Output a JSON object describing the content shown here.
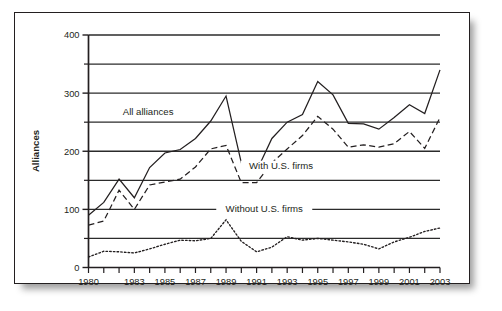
{
  "figure": {
    "name": "alliances-line-chart",
    "frame": {
      "border_color": "#231f20",
      "background": "#ffffff"
    }
  },
  "chart_data": {
    "type": "line",
    "title": "",
    "xlabel": "",
    "ylabel": "Alliances",
    "xlim": [
      1980,
      2003
    ],
    "ylim": [
      0,
      400
    ],
    "grid": true,
    "grid_interval": 50,
    "legend_position": "inline-annotations",
    "x": [
      1980,
      1981,
      1982,
      1983,
      1984,
      1985,
      1986,
      1987,
      1988,
      1989,
      1990,
      1991,
      1992,
      1993,
      1994,
      1995,
      1996,
      1997,
      1998,
      1999,
      2000,
      2001,
      2002,
      2003
    ],
    "x_tick_labels": [
      "1980",
      "",
      "",
      "1983",
      "",
      "1985",
      "",
      "1987",
      "",
      "1989",
      "",
      "1991",
      "",
      "1993",
      "",
      "1995",
      "",
      "1997",
      "",
      "1999",
      "",
      "2001",
      "",
      "2003"
    ],
    "y_tick_labels": [
      "0",
      "100",
      "200",
      "300",
      "400"
    ],
    "y_ticks": [
      0,
      100,
      200,
      300,
      400
    ],
    "series": [
      {
        "name": "All alliances",
        "style": "solid",
        "color": "#231f20",
        "label": "All alliances",
        "values": [
          90,
          112,
          152,
          120,
          172,
          197,
          203,
          222,
          252,
          295,
          180,
          166,
          222,
          250,
          263,
          320,
          297,
          248,
          247,
          238,
          258,
          280,
          265,
          340
        ]
      },
      {
        "name": "With U.S. firms",
        "style": "dashed",
        "color": "#231f20",
        "label": "With U.S. firms",
        "values": [
          73,
          80,
          133,
          100,
          142,
          147,
          152,
          173,
          204,
          210,
          146,
          146,
          180,
          204,
          227,
          260,
          238,
          207,
          211,
          207,
          213,
          234,
          205,
          258
        ]
      },
      {
        "name": "Without U.S. firms",
        "style": "dotted",
        "color": "#231f20",
        "label": "Without U.S. firms",
        "values": [
          18,
          28,
          27,
          25,
          32,
          40,
          47,
          46,
          50,
          82,
          45,
          27,
          35,
          53,
          47,
          50,
          47,
          44,
          40,
          32,
          44,
          52,
          62,
          68
        ]
      }
    ],
    "annotations": [
      {
        "text": "All alliances",
        "x": 1983.9,
        "y": 262
      },
      {
        "text": "With U.S. firms",
        "x": 1992.6,
        "y": 170
      },
      {
        "text": "Without U.S. firms",
        "x": 1991.5,
        "y": 96
      }
    ]
  }
}
